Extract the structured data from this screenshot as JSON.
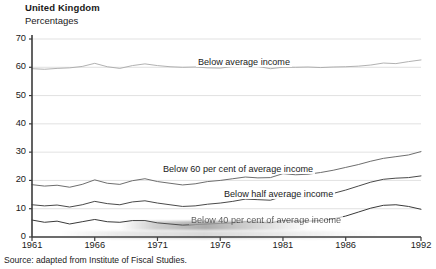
{
  "header": {
    "country_title": "United Kingdom",
    "units_subtitle": "Percentages"
  },
  "footer": {
    "source_note": "Source:  adapted from Institute of Fiscal Studies."
  },
  "chart_data": {
    "type": "line",
    "title": "United Kingdom",
    "subtitle": "Percentages",
    "xlabel": "",
    "ylabel": "Percentages",
    "ylim": [
      0,
      70
    ],
    "xlim": [
      1961,
      1992
    ],
    "grid": true,
    "grid_orientation": "horizontal",
    "legend": "inline-labels",
    "yticks": [
      0,
      10,
      20,
      30,
      40,
      50,
      60,
      70
    ],
    "ytick_labels": [
      "0",
      "10",
      "20",
      "30",
      "40",
      "50",
      "60",
      "70"
    ],
    "xticks": [
      1961,
      1966,
      1971,
      1976,
      1981,
      1986,
      1992
    ],
    "xtick_labels": [
      "1961",
      "1966",
      "1971",
      "1976",
      "1981",
      "1986",
      "1992"
    ],
    "x": [
      1961,
      1962,
      1963,
      1964,
      1965,
      1966,
      1967,
      1968,
      1969,
      1970,
      1971,
      1972,
      1973,
      1974,
      1975,
      1976,
      1977,
      1978,
      1979,
      1980,
      1981,
      1982,
      1983,
      1984,
      1985,
      1986,
      1987,
      1988,
      1989,
      1990,
      1991,
      1992
    ],
    "series": [
      {
        "name": "Below average income",
        "label": "Below average income",
        "color": "#a8a8a8",
        "values": [
          59.5,
          59.3,
          59.6,
          59.8,
          60.3,
          61.4,
          60.2,
          59.6,
          60.6,
          61.2,
          60.6,
          60.2,
          60.0,
          60.1,
          59.8,
          59.7,
          60.3,
          61.4,
          60.3,
          59.5,
          60.0,
          60.0,
          60.1,
          59.9,
          60.1,
          60.2,
          60.4,
          60.8,
          61.5,
          61.3,
          62.0,
          62.6
        ]
      },
      {
        "name": "Below 60 per cent of average income",
        "label": "Below 60 per cent  of average income",
        "color": "#6e6e6e",
        "values": [
          18.5,
          18.0,
          18.3,
          17.6,
          18.6,
          20.2,
          19.0,
          18.6,
          19.9,
          20.6,
          19.6,
          19.0,
          18.4,
          18.8,
          19.6,
          20.0,
          20.6,
          21.2,
          20.9,
          21.0,
          22.4,
          22.0,
          22.2,
          22.8,
          23.6,
          24.6,
          25.6,
          26.8,
          27.8,
          28.4,
          29.0,
          30.2
        ]
      },
      {
        "name": "Below half average income",
        "label": "Below half average income",
        "color": "#4a4a4a",
        "values": [
          11.4,
          11.0,
          11.3,
          10.6,
          11.4,
          12.6,
          11.8,
          11.4,
          12.4,
          12.8,
          12.0,
          11.4,
          10.8,
          11.0,
          11.6,
          12.0,
          12.6,
          13.4,
          13.2,
          13.0,
          14.4,
          14.2,
          14.2,
          14.8,
          15.4,
          16.6,
          18.0,
          19.4,
          20.4,
          20.8,
          21.0,
          21.6
        ]
      },
      {
        "name": "Below 40 per cent of average income",
        "label": "Below 40 per cent of average income",
        "color": "#3a3a3a",
        "values": [
          6.0,
          5.2,
          5.6,
          4.6,
          5.4,
          6.2,
          5.4,
          5.2,
          5.8,
          5.8,
          5.0,
          4.6,
          4.2,
          4.4,
          4.6,
          4.8,
          5.0,
          5.4,
          5.2,
          5.0,
          5.8,
          5.6,
          5.6,
          5.8,
          6.4,
          7.4,
          8.8,
          10.2,
          11.2,
          11.4,
          10.8,
          9.8
        ]
      }
    ]
  },
  "labels": {
    "series_top": "Below average income",
    "series_60": "Below 60 per cent  of average income",
    "series_half": "Below half average income",
    "series_40": "Below 40 per cent of average income"
  }
}
